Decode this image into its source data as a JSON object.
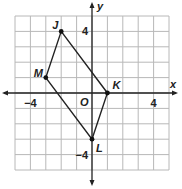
{
  "diagram": {
    "type": "coordinate-plane",
    "grid": {
      "xmin": -5,
      "xmax": 5,
      "ymin": -5,
      "ymax": 5,
      "step": 1
    },
    "axes": {
      "x_label": "x",
      "y_label": "y",
      "origin_label": "O",
      "x_tick_labels": [
        {
          "value": -4,
          "text": "−4"
        },
        {
          "value": 4,
          "text": "4"
        }
      ],
      "y_tick_labels": [
        {
          "value": 4,
          "text": "4"
        },
        {
          "value": -4,
          "text": "−4"
        }
      ]
    },
    "polygon": {
      "name": "JKLM",
      "vertices": [
        {
          "label": "J",
          "x": -2,
          "y": 4
        },
        {
          "label": "K",
          "x": 1,
          "y": 0
        },
        {
          "label": "L",
          "x": 0,
          "y": -3
        },
        {
          "label": "M",
          "x": -3,
          "y": 1
        }
      ]
    },
    "colors": {
      "grid": "#b8b8b8",
      "axis": "#222222",
      "polygon": "#222222",
      "point": "#111111"
    }
  }
}
